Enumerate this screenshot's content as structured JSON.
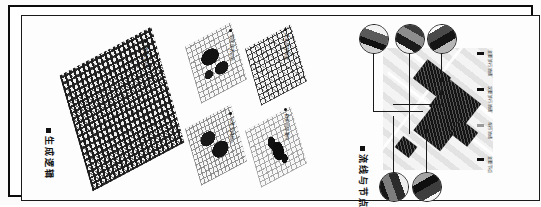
{
  "board": {
    "orientation": "rotated-90-vertical-text",
    "frame_color": "#0b0b0b",
    "background": "#ffffff"
  },
  "left_page": {
    "title": "生成逻辑",
    "main_map": {
      "caption": "整体生成",
      "bullet": "dot"
    },
    "small_maps": [
      {
        "caption": "肌理现状分析",
        "bullet": "dot"
      },
      {
        "caption": "工业遗存提取",
        "bullet": "dot"
      },
      {
        "caption": "公共空间植入",
        "bullet": "dot"
      },
      {
        "caption": "街巷肌理重构",
        "bullet": "dot"
      }
    ]
  },
  "right_page": {
    "title": "流线与节点",
    "legend": {
      "items": [
        {
          "label": "主要步行流线",
          "swatch": "#111111",
          "style": "solid"
        },
        {
          "label": "次要步行流线",
          "swatch": "#111111",
          "style": "solid"
        },
        {
          "label": "车行流线",
          "swatch": "#9a9a9a",
          "style": "hollow"
        },
        {
          "label": "主要节点",
          "swatch": "#111111",
          "style": "solid"
        }
      ]
    },
    "callouts": [
      {
        "id": "node-1",
        "position": "top-left"
      },
      {
        "id": "node-2",
        "position": "top-center"
      },
      {
        "id": "node-3",
        "position": "top-right"
      },
      {
        "id": "node-4",
        "position": "bottom-left"
      },
      {
        "id": "node-5",
        "position": "bottom-right"
      }
    ]
  }
}
